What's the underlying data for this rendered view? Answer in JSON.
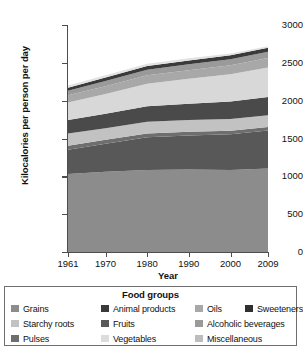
{
  "chart_data": {
    "type": "area",
    "title": "",
    "xlabel": "Year",
    "ylabel": "Kilocalories per person per day",
    "xlim": [
      1961,
      2009
    ],
    "ylim": [
      0,
      3000
    ],
    "yticks": [
      0,
      500,
      1000,
      1500,
      2000,
      2500,
      3000
    ],
    "xticks": [
      1961,
      1970,
      1980,
      1990,
      2000,
      2009
    ],
    "grid": false,
    "stacked": true,
    "legend_position": "below",
    "legend_title": "Food groups",
    "x": [
      1961,
      1970,
      1980,
      1990,
      2000,
      2009
    ],
    "series": [
      {
        "name": "Grains",
        "color": "#8c8c8c",
        "values": [
          1030,
          1060,
          1085,
          1090,
          1085,
          1105
        ]
      },
      {
        "name": "Animal products",
        "color": "#585858",
        "values": [
          320,
          370,
          430,
          450,
          470,
          500
        ]
      },
      {
        "name": "Pulses",
        "color": "#6e6e6e",
        "values": [
          55,
          52,
          50,
          48,
          48,
          48
        ]
      },
      {
        "name": "Starchy roots",
        "color": "#c2c2c2",
        "values": [
          160,
          155,
          155,
          155,
          155,
          155
        ]
      },
      {
        "name": "Fruits",
        "color": "#4a4a4a",
        "values": [
          180,
          190,
          205,
          215,
          230,
          240
        ]
      },
      {
        "name": "Vegetables",
        "color": "#d8d8d8",
        "values": [
          230,
          260,
          300,
          330,
          360,
          390
        ]
      },
      {
        "name": "Oils",
        "color": "#a8a8a8",
        "values": [
          95,
          105,
          110,
          115,
          120,
          125
        ]
      },
      {
        "name": "Alcoholic beverages",
        "color": "#9a9a9a",
        "values": [
          60,
          68,
          75,
          78,
          80,
          82
        ]
      },
      {
        "name": "Sweeteners",
        "color": "#3a3a3a",
        "values": [
          40,
          45,
          48,
          50,
          52,
          53
        ]
      },
      {
        "name": "Miscellaneous",
        "color": "#e2e2e2",
        "values": [
          30,
          30,
          30,
          28,
          25,
          22
        ]
      }
    ],
    "totals": [
      2200,
      2335,
      2488,
      2559,
      2625,
      2720
    ]
  },
  "axes": {
    "ylabel": "Kilocalories per person per day",
    "xlabel": "Year",
    "ytick_labels": [
      "0",
      "500",
      "1000",
      "1500",
      "2000",
      "2500",
      "3000"
    ],
    "xtick_labels": [
      "1961",
      "1970",
      "1980",
      "1990",
      "2000",
      "2009"
    ]
  },
  "legend": {
    "title": "Food groups",
    "items": [
      {
        "label": "Grains",
        "color": "#8c8c8c"
      },
      {
        "label": "Animal products",
        "color": "#3a3a3a"
      },
      {
        "label": "Oils",
        "color": "#a8a8a8"
      },
      {
        "label": "Sweeteners",
        "color": "#2f2f2f"
      },
      {
        "label": "Starchy roots",
        "color": "#c2c2c2"
      },
      {
        "label": "Fruits",
        "color": "#585858"
      },
      {
        "label": "Alcoholic beverages",
        "color": "#9a9a9a"
      },
      {
        "label": "Pulses",
        "color": "#6e6e6e"
      },
      {
        "label": "Vegetables",
        "color": "#dcdcdc"
      },
      {
        "label": "Miscellaneous",
        "color": "#bdbdbd"
      }
    ]
  }
}
